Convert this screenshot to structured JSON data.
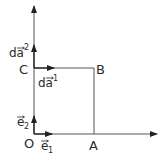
{
  "diagram": {
    "colors": {
      "line": "#555555",
      "arrow": "#222222",
      "text": "#2b2b2b"
    },
    "points": {
      "O": {
        "label": "O"
      },
      "A": {
        "label": "A"
      },
      "B": {
        "label": "B"
      },
      "C": {
        "label": "C"
      }
    },
    "vectors": {
      "e1": {
        "base": "e",
        "sub": "1"
      },
      "e2": {
        "base": "e",
        "sub": "2"
      },
      "da1": {
        "base": "da",
        "sup": "1"
      },
      "da2": {
        "base": "da",
        "sup": "2"
      }
    }
  }
}
